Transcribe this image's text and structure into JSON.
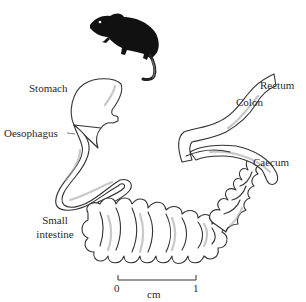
{
  "figure": {
    "labels": {
      "stomach": "Stomach",
      "oesophagus": "Oesophagus",
      "small_intestine_line1": "Small",
      "small_intestine_line2": "intestine",
      "rectum": "Rectum",
      "colon": "Colon",
      "caecum": "Caecum"
    },
    "scale_bar": {
      "start": "0",
      "end": "1",
      "unit": "cm"
    },
    "icons": {
      "animal": "mouse-silhouette"
    },
    "colors": {
      "ink": "#333333",
      "silhouette": "#111111",
      "background": "#ffffff"
    }
  }
}
